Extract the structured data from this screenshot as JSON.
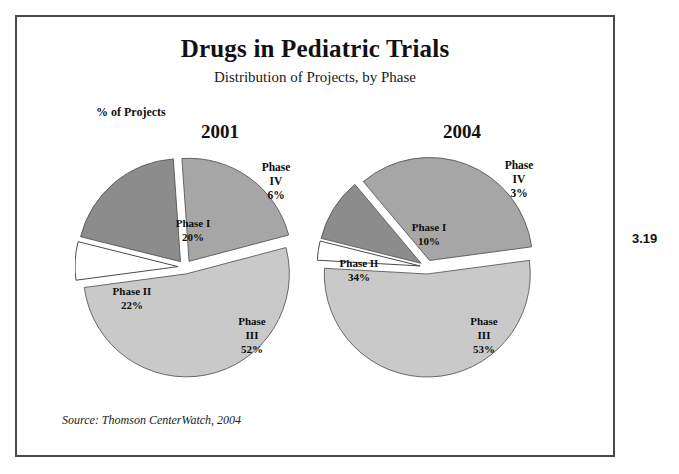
{
  "figure": {
    "title": "Drugs in Pediatric Trials",
    "subtitle": "Distribution of Projects, by Phase",
    "axis_note": "% of Projects",
    "source": "Source: Thomson CenterWatch, 2004",
    "figure_number": "3.19"
  },
  "colors": {
    "phase_i": "#8c8c8c",
    "phase_ii": "#a6a6a6",
    "phase_iii": "#c9c9c9",
    "phase_iv": "#ffffff",
    "slice_outline": "#4a4a4a",
    "frame": "#4a4a4a",
    "text": "#111111"
  },
  "chart_data": [
    {
      "type": "pie",
      "title": "2001",
      "subtitle": "Distribution of Projects, by Phase",
      "ylabel": "% of Projects",
      "categories": [
        "Phase I",
        "Phase II",
        "Phase III",
        "Phase IV"
      ],
      "values": [
        20,
        22,
        52,
        6
      ],
      "labels": [
        "Phase I\n20%",
        "Phase II\n22%",
        "Phase\nIII\n52%",
        "Phase\nIV\n6%"
      ],
      "value_labels": [
        "20%",
        "22%",
        "52%",
        "6%"
      ],
      "exploded": [
        true,
        true,
        true,
        true
      ],
      "legend_position": "none",
      "grid": false
    },
    {
      "type": "pie",
      "title": "2004",
      "subtitle": "Distribution of Projects, by Phase",
      "ylabel": "% of Projects",
      "categories": [
        "Phase I",
        "Phase II",
        "Phase III",
        "Phase IV"
      ],
      "values": [
        10,
        34,
        53,
        3
      ],
      "labels": [
        "Phase I\n10%",
        "Phase II\n34%",
        "Phase\nIII\n53%",
        "Phase\nIV\n3%"
      ],
      "value_labels": [
        "10%",
        "34%",
        "53%",
        "3%"
      ],
      "exploded": [
        true,
        true,
        true,
        true
      ],
      "legend_position": "none",
      "grid": false
    }
  ],
  "pies": [
    {
      "year": "2001",
      "slices": [
        {
          "name": "Phase I",
          "value": 20,
          "value_label": "20%",
          "label_lines": [
            "Phase I",
            "20%"
          ],
          "label_x": 118,
          "label_y": 80,
          "color_key": "phase_i"
        },
        {
          "name": "Phase II",
          "value": 22,
          "value_label": "22%",
          "label_lines": [
            "Phase II",
            "22%"
          ],
          "label_x": 57,
          "label_y": 148,
          "color_key": "phase_ii"
        },
        {
          "name": "Phase III",
          "value": 52,
          "value_label": "52%",
          "label_lines": [
            "Phase",
            "III",
            "52%"
          ],
          "label_x": 177,
          "label_y": 178,
          "color_key": "phase_iii"
        },
        {
          "name": "Phase IV",
          "value": 6,
          "value_label": "6%",
          "label_lines": [
            "Phase",
            "IV",
            "6%"
          ],
          "label_x": 201,
          "label_y": 24,
          "color_key": "phase_iv"
        }
      ]
    },
    {
      "year": "2004",
      "slices": [
        {
          "name": "Phase I",
          "value": 10,
          "value_label": "10%",
          "label_lines": [
            "Phase I",
            "10%"
          ],
          "label_x": 112,
          "label_y": 84,
          "color_key": "phase_i"
        },
        {
          "name": "Phase II",
          "value": 34,
          "value_label": "34%",
          "label_lines": [
            "Phase II",
            "34%"
          ],
          "label_x": 42,
          "label_y": 120,
          "color_key": "phase_ii"
        },
        {
          "name": "Phase III",
          "value": 53,
          "value_label": "53%",
          "label_lines": [
            "Phase",
            "III",
            "53%"
          ],
          "label_x": 167,
          "label_y": 178,
          "color_key": "phase_iii"
        },
        {
          "name": "Phase IV",
          "value": 3,
          "value_label": "3%",
          "label_lines": [
            "Phase",
            "IV",
            "3%"
          ],
          "label_x": 202,
          "label_y": 22,
          "color_key": "phase_iv"
        }
      ]
    }
  ]
}
